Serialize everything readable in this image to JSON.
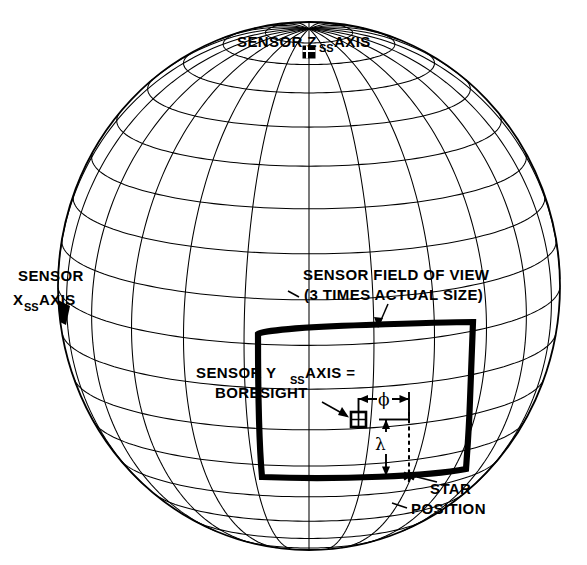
{
  "figure": {
    "type": "technical-diagram",
    "background_color": "#ffffff",
    "line_color": "#000000"
  },
  "labels": {
    "z_axis": {
      "prefix": "SENSOR Z",
      "subscript": "SS",
      "suffix": " AXIS",
      "marker": "filled-square"
    },
    "x_axis": {
      "line1": "SENSOR",
      "prefix": "X",
      "subscript": "SS",
      "suffix": " AXIS",
      "marker": "filled-wedge"
    },
    "fov": {
      "line1": "SENSOR FIELD OF VIEW",
      "line2": "(3 TIMES ACTUAL SIZE)"
    },
    "boresight": {
      "prefix": "SENSOR Y",
      "subscript": "SS",
      "suffix": " AXIS =",
      "line2": "BORESIGHT",
      "marker": "crossed-square"
    },
    "star": {
      "line1": "STAR",
      "line2": "POSITION",
      "marker": "asterisk-star"
    }
  },
  "angles": {
    "phi": {
      "symbol": "ϕ",
      "orientation": "horizontal",
      "meaning": "azimuth offset from boresight"
    },
    "lambda": {
      "symbol": "λ",
      "orientation": "vertical",
      "meaning": "elevation offset from boresight"
    }
  },
  "chart_data": {
    "type": "diagram",
    "title": "",
    "sphere": {
      "center_x": 309,
      "center_y": 286,
      "radius_x": 251,
      "radius_y": 264,
      "meridian_step_deg": 15,
      "parallel_step_deg": 10,
      "meridian_count": 24,
      "parallel_count": 17
    },
    "markers": [
      {
        "name": "sensor-z-axis",
        "x": 309,
        "y": 52,
        "glyph": "filled-square"
      },
      {
        "name": "sensor-x-axis",
        "x": 62,
        "y": 312,
        "glyph": "filled-wedge"
      },
      {
        "name": "boresight",
        "x": 358,
        "y": 419,
        "glyph": "crossed-square"
      },
      {
        "name": "star-position",
        "x": 409,
        "y": 476,
        "glyph": "star"
      }
    ],
    "fov_box": {
      "corners": [
        [
          258,
          332
        ],
        [
          473,
          323
        ],
        [
          464,
          468
        ],
        [
          260,
          478
        ]
      ],
      "stroke_width": 6.2,
      "note": "3 times actual size"
    }
  }
}
